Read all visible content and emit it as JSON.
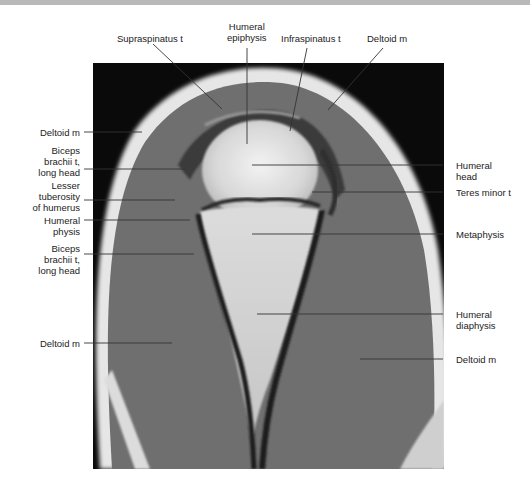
{
  "figure": {
    "image_description": "Coronal T1-weighted MRI of shoulder / proximal humerus",
    "labels": {
      "supraspinatus": "Supraspinatus t",
      "humeral_epiphysis": "Humeral\nepiphysis",
      "infraspinatus": "Infraspinatus t",
      "deltoid_top": "Deltoid m",
      "deltoid_left_upper": "Deltoid m",
      "biceps_upper": "Biceps\nbrachii t,\nlong head",
      "lesser_tuberosity": "Lesser\ntuberosity\nof humerus",
      "humeral_physis": "Humeral\nphysis",
      "biceps_lower": "Biceps\nbrachii t,\nlong head",
      "deltoid_left_lower": "Deltoid m",
      "humeral_head": "Humeral\nhead",
      "teres_minor": "Teres minor t",
      "metaphysis": "Metaphysis",
      "humeral_diaphysis": "Humeral\ndiaphysis",
      "deltoid_right": "Deltoid m"
    },
    "colors": {
      "background": "#ffffff",
      "mri_black": "#0a0a0a",
      "muscle_gray": "#6e6e6e",
      "fat_white": "#e8e8e8",
      "bone_marrow": "#d4d4d4",
      "leader_line": "#333333"
    }
  }
}
